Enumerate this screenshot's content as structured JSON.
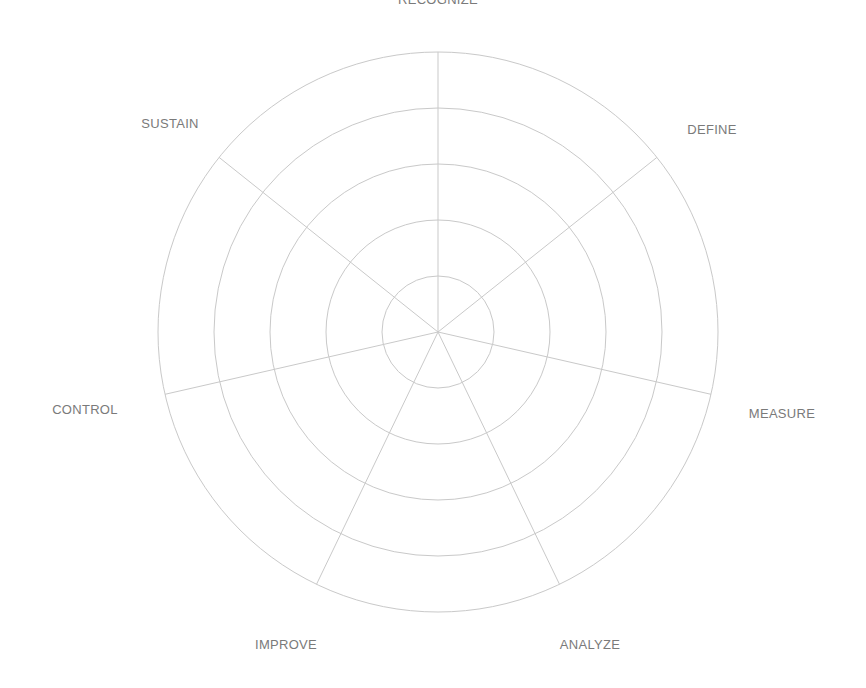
{
  "chart_data": {
    "type": "radar",
    "title": "",
    "axes": [
      "RECOGNIZE",
      "DEFINE",
      "MEASURE",
      "ANALYZE",
      "IMPROVE",
      "CONTROL",
      "SUSTAIN"
    ],
    "rings": 5,
    "series": [],
    "grid": true,
    "legend": "none",
    "colors": {
      "grid": "#c9c9c9",
      "label": "#7a7a7a"
    }
  },
  "layout": {
    "center_x": 438,
    "center_y": 332,
    "radius": 280,
    "label_positions": [
      {
        "x": 438,
        "y": 4,
        "anchor": "middle"
      },
      {
        "x": 712,
        "y": 134,
        "anchor": "middle"
      },
      {
        "x": 782,
        "y": 418,
        "anchor": "middle"
      },
      {
        "x": 590,
        "y": 649,
        "anchor": "middle"
      },
      {
        "x": 286,
        "y": 649,
        "anchor": "middle"
      },
      {
        "x": 85,
        "y": 414,
        "anchor": "middle"
      },
      {
        "x": 170,
        "y": 128,
        "anchor": "middle"
      }
    ]
  }
}
